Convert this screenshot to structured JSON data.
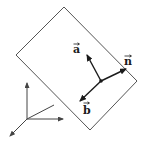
{
  "diagram": {
    "colors": {
      "plane_stroke": "#555555",
      "vector_stroke": "#1a1a1a",
      "axis_stroke": "#444444",
      "background": "#ffffff"
    },
    "plane": {
      "corners": [
        [
          64,
          7
        ],
        [
          137,
          81
        ],
        [
          90,
          130
        ],
        [
          16,
          55
        ]
      ]
    },
    "origin_point": [
      101,
      81
    ],
    "vectors": [
      {
        "id": "a",
        "label": "a",
        "to": [
          87,
          54
        ],
        "label_pos": [
          73,
          52
        ]
      },
      {
        "id": "n",
        "label": "n",
        "to": [
          126,
          69
        ],
        "label_pos": [
          124,
          63
        ]
      },
      {
        "id": "b",
        "label": "b",
        "to": [
          79,
          102
        ],
        "label_pos": [
          82,
          114
        ]
      }
    ],
    "axes": {
      "origin": [
        27,
        119
      ],
      "lines": [
        {
          "id": "axis-up",
          "to": [
            27,
            82
          ],
          "arrow": true
        },
        {
          "id": "axis-right",
          "to": [
            63,
            119
          ],
          "arrow": true
        },
        {
          "id": "axis-diag",
          "to": [
            54,
            105
          ],
          "arrow": false
        },
        {
          "id": "axis-down-left",
          "to": [
            9,
            137
          ],
          "arrow": true
        }
      ]
    }
  }
}
